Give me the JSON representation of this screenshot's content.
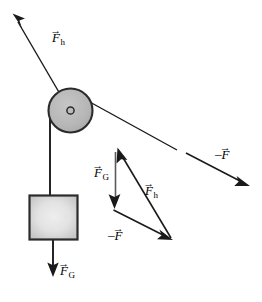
{
  "figure": {
    "background_color": "#ffffff",
    "stroke_color": "#1a1a1a",
    "width": 262,
    "height": 302
  },
  "pulley": {
    "name": "pulley-wheel",
    "center_x": 70.5,
    "center_y": 110.5,
    "radius": 22.5,
    "fill_color": "#b9b9b9",
    "edge_color": "#2b2b2b",
    "hub_radius": 4,
    "hub_fill_color": "#b9b9b9"
  },
  "block": {
    "name": "hanging-block",
    "x": 29,
    "y": 195,
    "width": 49,
    "height": 45,
    "fill_center_color": "#ebebeb",
    "fill_edge_color": "#c9c9c9",
    "edge_color": "#2b2b2b"
  },
  "ropes": [
    {
      "name": "rope-upper-left",
      "from": [
        67,
        106
      ],
      "to": [
        13,
        14
      ]
    },
    {
      "name": "rope-right-segment",
      "from": [
        88,
        101
      ],
      "to": [
        177,
        150
      ]
    },
    {
      "name": "rope-vertical",
      "from": [
        50,
        112
      ],
      "to": [
        50,
        196
      ]
    },
    {
      "name": "rope-block-interior",
      "from": [
        53,
        196
      ],
      "to": [
        53,
        241
      ]
    }
  ],
  "vectors": [
    {
      "name": "vector-Fh-rope",
      "label_text": "F",
      "label_subscript": "h",
      "label_sign": "",
      "label_x": 52,
      "label_y": 31,
      "from": [
        67,
        106
      ],
      "to": [
        13,
        14
      ],
      "description": "Hand force along rope, up and to the left"
    },
    {
      "name": "vector-minusF-right",
      "label_text": "F",
      "label_subscript": "",
      "label_sign": "–",
      "label_x": 215,
      "label_y": 148,
      "from": [
        186,
        153
      ],
      "to": [
        249,
        186
      ],
      "description": "Reaction force, down and to the right"
    },
    {
      "name": "vector-FG-block",
      "label_text": "F",
      "label_subscript": "G",
      "label_sign": "",
      "label_x": 57,
      "label_y": 267,
      "from": [
        53,
        241
      ],
      "to": [
        53,
        277
      ],
      "description": "Gravitational force on block, straight down"
    },
    {
      "name": "vector-FG-triangle",
      "label_text": "F",
      "label_subscript": "G",
      "label_sign": "",
      "label_x": 95,
      "label_y": 168,
      "from": [
        115,
        152
      ],
      "to": [
        115,
        208
      ],
      "description": "Triangle side: gravitational force, downward"
    },
    {
      "name": "vector-Fh-triangle",
      "label_text": "F",
      "label_subscript": "h",
      "label_sign": "",
      "label_x": 145,
      "label_y": 186,
      "from": [
        170,
        238
      ],
      "to": [
        118,
        148
      ],
      "description": "Triangle side: hand force, up and to the left"
    },
    {
      "name": "vector-minusF-triangle",
      "label_text": "F",
      "label_subscript": "",
      "label_sign": "–",
      "label_x": 110,
      "label_y": 231,
      "from": [
        113,
        210
      ],
      "to": [
        172,
        240
      ],
      "description": "Triangle side: reaction force, down and to the right"
    }
  ],
  "glyphs": {
    "vector_arrow": "→",
    "minus_sign": "–"
  }
}
